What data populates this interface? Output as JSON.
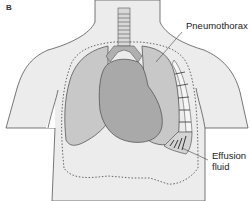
{
  "figure": {
    "panel_label": "B",
    "labels": {
      "pneumothorax": "Pneumothorax",
      "effusion_line1": "Effusion",
      "effusion_line2": "fluid"
    },
    "colors": {
      "background": "#ffffff",
      "body": "#ececec",
      "lung": "#c8c8c8",
      "heart": "#a9a9a9",
      "outline": "#555555",
      "dotted": "#555555"
    }
  }
}
